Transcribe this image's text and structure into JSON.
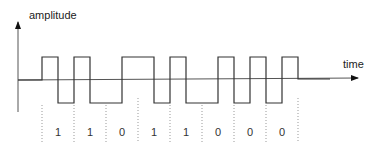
{
  "diagram": {
    "y_axis_label": "amplitude",
    "x_axis_label": "time",
    "bits": [
      "1",
      "1",
      "0",
      "1",
      "1",
      "0",
      "0",
      "0"
    ],
    "encoding_note": "each bit: 1 = high then low, 0 = low then high",
    "colors": {
      "waveform": "#333333",
      "axis": "#555555",
      "separator": "#888888",
      "text": "#222222"
    }
  }
}
